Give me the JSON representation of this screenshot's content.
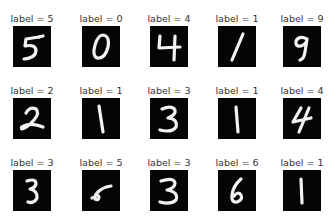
{
  "figure": {
    "rows": 3,
    "cols": 5,
    "label_prefix": "label = ",
    "image_background": "#050505",
    "stroke_color": "#f2f2f2"
  },
  "samples": [
    {
      "label": "label = 5",
      "digit": "5"
    },
    {
      "label": "label = 0",
      "digit": "0"
    },
    {
      "label": "label = 4",
      "digit": "4"
    },
    {
      "label": "label = 1",
      "digit": "1"
    },
    {
      "label": "label = 9",
      "digit": "9"
    },
    {
      "label": "label = 2",
      "digit": "2"
    },
    {
      "label": "label = 1",
      "digit": "1"
    },
    {
      "label": "label = 3",
      "digit": "3"
    },
    {
      "label": "label = 1",
      "digit": "1"
    },
    {
      "label": "label = 4",
      "digit": "4"
    },
    {
      "label": "label = 3",
      "digit": "3"
    },
    {
      "label": "label = 5",
      "digit": "5"
    },
    {
      "label": "label = 3",
      "digit": "3"
    },
    {
      "label": "label = 6",
      "digit": "6"
    },
    {
      "label": "label = 1",
      "digit": "1"
    }
  ]
}
